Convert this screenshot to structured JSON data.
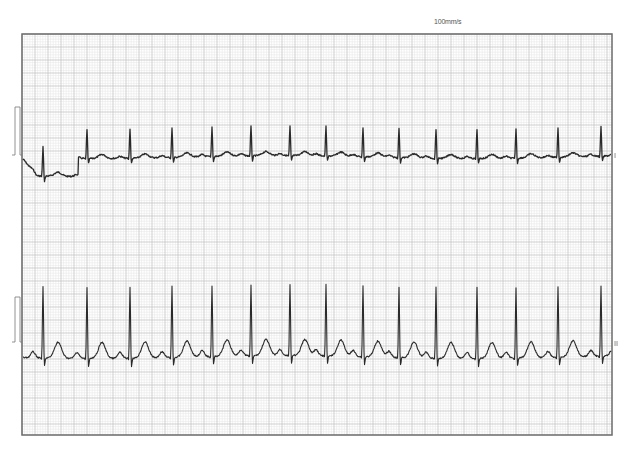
{
  "header": {
    "paper_speed": "100mm/s"
  },
  "leads": [
    {
      "label": "I"
    },
    {
      "label": "II"
    }
  ],
  "colors": {
    "grid_minor": "#e4e4e4",
    "grid_major": "#bdbdbd",
    "border": "#6b6b6b",
    "trace": "#2a2a2a",
    "cal": "#777777"
  },
  "chart_data": {
    "type": "line",
    "subtitle": "100mm/s",
    "xlabel": "",
    "ylabel": "",
    "grid": true,
    "legend": [],
    "frame": {
      "x0": 22,
      "y0": 34,
      "x1": 612,
      "y1": 435,
      "minor": 2.6,
      "major": 13
    },
    "series": [
      {
        "name": "I",
        "baseline_y": 157,
        "r_peaks_x": [
          43,
          87,
          130,
          172,
          212,
          251,
          290,
          326,
          363,
          399,
          436,
          477,
          516,
          558,
          601
        ],
        "r_height": 30,
        "s_depth": 6,
        "t_height": 4,
        "p_height": 2,
        "artifact": {
          "x_start": 22,
          "x_end": 80,
          "offset": 18
        }
      },
      {
        "name": "II",
        "baseline_y": 357,
        "r_peaks_x": [
          43,
          87,
          130,
          172,
          212,
          251,
          290,
          326,
          363,
          399,
          436,
          477,
          516,
          558,
          601
        ],
        "r_height": 72,
        "s_depth": 10,
        "t_height": 16,
        "p_height": 6
      }
    ],
    "calibration": [
      {
        "lead": "I",
        "x": 12,
        "top": 107,
        "bottom": 155
      },
      {
        "lead": "II",
        "x": 12,
        "top": 297,
        "bottom": 342
      }
    ]
  }
}
